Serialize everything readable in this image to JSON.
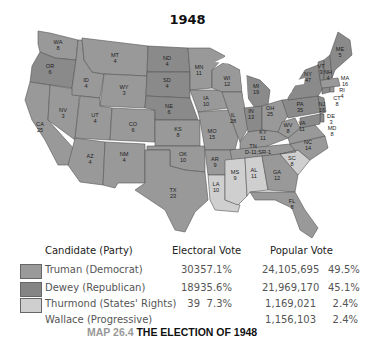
{
  "title": "1948",
  "colors": {
    "truman": "#9a9a9a",
    "dewey": "#8a8a8a",
    "thurmond": "#cfcfcf",
    "wallace": "#ffffff",
    "lakes": "#ffffff"
  },
  "map": {
    "states": [
      {
        "abbr": "WA",
        "ev": "8",
        "winner": "truman"
      },
      {
        "abbr": "OR",
        "ev": "6",
        "winner": "dewey"
      },
      {
        "abbr": "CA",
        "ev": "25",
        "winner": "truman"
      },
      {
        "abbr": "NV",
        "ev": "3",
        "winner": "truman"
      },
      {
        "abbr": "ID",
        "ev": "4",
        "winner": "truman"
      },
      {
        "abbr": "MT",
        "ev": "4",
        "winner": "truman"
      },
      {
        "abbr": "WY",
        "ev": "3",
        "winner": "truman"
      },
      {
        "abbr": "UT",
        "ev": "4",
        "winner": "truman"
      },
      {
        "abbr": "CO",
        "ev": "6",
        "winner": "truman"
      },
      {
        "abbr": "AZ",
        "ev": "4",
        "winner": "truman"
      },
      {
        "abbr": "NM",
        "ev": "4",
        "winner": "truman"
      },
      {
        "abbr": "ND",
        "ev": "4",
        "winner": "dewey"
      },
      {
        "abbr": "SD",
        "ev": "4",
        "winner": "dewey"
      },
      {
        "abbr": "NE",
        "ev": "6",
        "winner": "dewey"
      },
      {
        "abbr": "KS",
        "ev": "8",
        "winner": "truman"
      },
      {
        "abbr": "OK",
        "ev": "10",
        "winner": "truman"
      },
      {
        "abbr": "TX",
        "ev": "23",
        "winner": "truman"
      },
      {
        "abbr": "MN",
        "ev": "11",
        "winner": "truman"
      },
      {
        "abbr": "IA",
        "ev": "10",
        "winner": "truman"
      },
      {
        "abbr": "MO",
        "ev": "15",
        "winner": "truman"
      },
      {
        "abbr": "AR",
        "ev": "9",
        "winner": "truman"
      },
      {
        "abbr": "LA",
        "ev": "10",
        "winner": "thurmond"
      },
      {
        "abbr": "WI",
        "ev": "12",
        "winner": "truman"
      },
      {
        "abbr": "IL",
        "ev": "28",
        "winner": "truman"
      },
      {
        "abbr": "MI",
        "ev": "19",
        "winner": "dewey"
      },
      {
        "abbr": "IN",
        "ev": "13",
        "winner": "dewey"
      },
      {
        "abbr": "OH",
        "ev": "25",
        "winner": "truman"
      },
      {
        "abbr": "KY",
        "ev": "11",
        "winner": "truman"
      },
      {
        "abbr": "TN",
        "ev": "D-11; SR-1",
        "winner": "truman"
      },
      {
        "abbr": "MS",
        "ev": "9",
        "winner": "thurmond"
      },
      {
        "abbr": "AL",
        "ev": "11",
        "winner": "thurmond"
      },
      {
        "abbr": "GA",
        "ev": "12",
        "winner": "truman"
      },
      {
        "abbr": "FL",
        "ev": "8",
        "winner": "truman"
      },
      {
        "abbr": "SC",
        "ev": "8",
        "winner": "thurmond"
      },
      {
        "abbr": "NC",
        "ev": "14",
        "winner": "truman"
      },
      {
        "abbr": "VA",
        "ev": "11",
        "winner": "truman"
      },
      {
        "abbr": "WV",
        "ev": "8",
        "winner": "truman"
      },
      {
        "abbr": "PA",
        "ev": "35",
        "winner": "dewey"
      },
      {
        "abbr": "NY",
        "ev": "47",
        "winner": "dewey"
      },
      {
        "abbr": "NJ",
        "ev": "16",
        "winner": "dewey"
      },
      {
        "abbr": "DE",
        "ev": "3",
        "winner": "dewey"
      },
      {
        "abbr": "MD",
        "ev": "8",
        "winner": "dewey"
      },
      {
        "abbr": "CT",
        "ev": "8",
        "winner": "dewey"
      },
      {
        "abbr": "RI",
        "ev": "4",
        "winner": "truman"
      },
      {
        "abbr": "MA",
        "ev": "16",
        "winner": "truman"
      },
      {
        "abbr": "VT",
        "ev": "3",
        "winner": "dewey"
      },
      {
        "abbr": "NH",
        "ev": "4",
        "winner": "dewey"
      },
      {
        "abbr": "ME",
        "ev": "5",
        "winner": "dewey"
      }
    ]
  },
  "legend": {
    "headers": {
      "candidate": "Candidate (Party)",
      "electoral": "Electoral Vote",
      "popular": "Popular Vote"
    },
    "rows": [
      {
        "candidate": "Truman (Democrat)",
        "ev": "303",
        "ev_pct": "57.1%",
        "pv": "24,105,695",
        "pv_pct": "49.5%",
        "swatch": "#9a9a9a"
      },
      {
        "candidate": "Dewey (Republican)",
        "ev": "189",
        "ev_pct": "35.6%",
        "pv": "21,969,170",
        "pv_pct": "45.1%",
        "swatch": "#858585"
      },
      {
        "candidate": "Thurmond (States' Rights)",
        "ev": "39",
        "ev_pct": "7.3%",
        "pv": "1,169,021",
        "pv_pct": "2.4%",
        "swatch": "#cfcfcf"
      },
      {
        "candidate": "Wallace (Progressive)",
        "ev": "",
        "ev_pct": "",
        "pv": "1,156,103",
        "pv_pct": "2.4%",
        "swatch": ""
      }
    ]
  },
  "caption": {
    "map_number": "MAP 26.4",
    "text": "THE ELECTION OF 1948"
  }
}
